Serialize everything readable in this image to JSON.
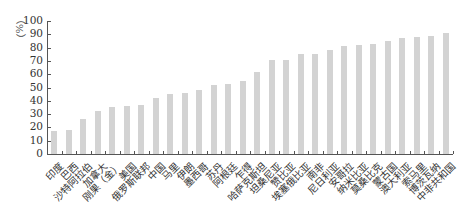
{
  "chart_data": {
    "type": "bar",
    "title": "",
    "xlabel": "",
    "ylabel": "（%）",
    "ylim": [
      0,
      100
    ],
    "yticks": [
      0,
      10,
      20,
      30,
      40,
      50,
      60,
      70,
      80,
      90,
      100
    ],
    "grid": false,
    "legend": null,
    "bar_color": "#d3d3d3",
    "categories": [
      "印度",
      "巴西",
      "沙特阿拉伯",
      "加拿大",
      "刚果（金）",
      "美国",
      "俄罗斯联邦",
      "中国",
      "马里",
      "伊朗",
      "墨西哥",
      "苏丹",
      "阿根廷",
      "乍得",
      "哈萨克斯坦",
      "坦桑尼亚",
      "赞比亚",
      "埃塞俄比亚",
      "南非",
      "尼日利亚",
      "安哥拉",
      "纳米比亚",
      "莫桑比克",
      "蒙古国",
      "澳大利亚",
      "索马里",
      "博茨瓦纳",
      "中非共和国"
    ],
    "values": [
      17,
      18,
      26,
      32,
      35,
      36,
      37,
      42,
      45,
      46,
      48,
      52,
      53,
      55,
      62,
      71,
      71,
      75,
      75,
      78,
      81,
      82,
      83,
      85,
      87,
      88,
      89,
      91
    ]
  }
}
